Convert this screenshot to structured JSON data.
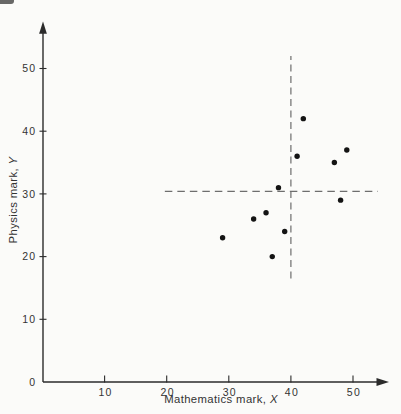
{
  "chart_data": {
    "type": "scatter",
    "title": "",
    "xlabel": "Mathematics mark, X",
    "xlabel_prefix": "Mathematics mark, ",
    "xlabel_var": "X",
    "ylabel": "Physics mark, Y",
    "ylabel_prefix": "Physics mark, ",
    "ylabel_var": "Y",
    "xlim": [
      0,
      56
    ],
    "ylim": [
      0,
      57.5
    ],
    "x_ticks": [
      10,
      20,
      30,
      40,
      50
    ],
    "y_ticks": [
      0,
      10,
      20,
      30,
      40,
      50
    ],
    "grid": false,
    "legend": null,
    "points": [
      {
        "x": 42,
        "y": 42
      },
      {
        "x": 49,
        "y": 37
      },
      {
        "x": 41,
        "y": 36
      },
      {
        "x": 47,
        "y": 35
      },
      {
        "x": 38,
        "y": 31
      },
      {
        "x": 48,
        "y": 29
      },
      {
        "x": 36,
        "y": 27
      },
      {
        "x": 34,
        "y": 26
      },
      {
        "x": 39,
        "y": 24
      },
      {
        "x": 29,
        "y": 23
      },
      {
        "x": 37,
        "y": 20
      }
    ],
    "mean_lines": {
      "vertical": {
        "x": 40,
        "y_from": 16.5,
        "y_to": 52,
        "style": "dashed"
      },
      "horizontal": {
        "y": 30.4,
        "x_from": 19.7,
        "x_to": 54,
        "style": "dashed"
      }
    },
    "colors": {
      "point": "#141414",
      "axis": "#2b2b2b",
      "dash": "#6e6e6e",
      "text": "#333333",
      "paper": "#fbfbf9"
    }
  }
}
